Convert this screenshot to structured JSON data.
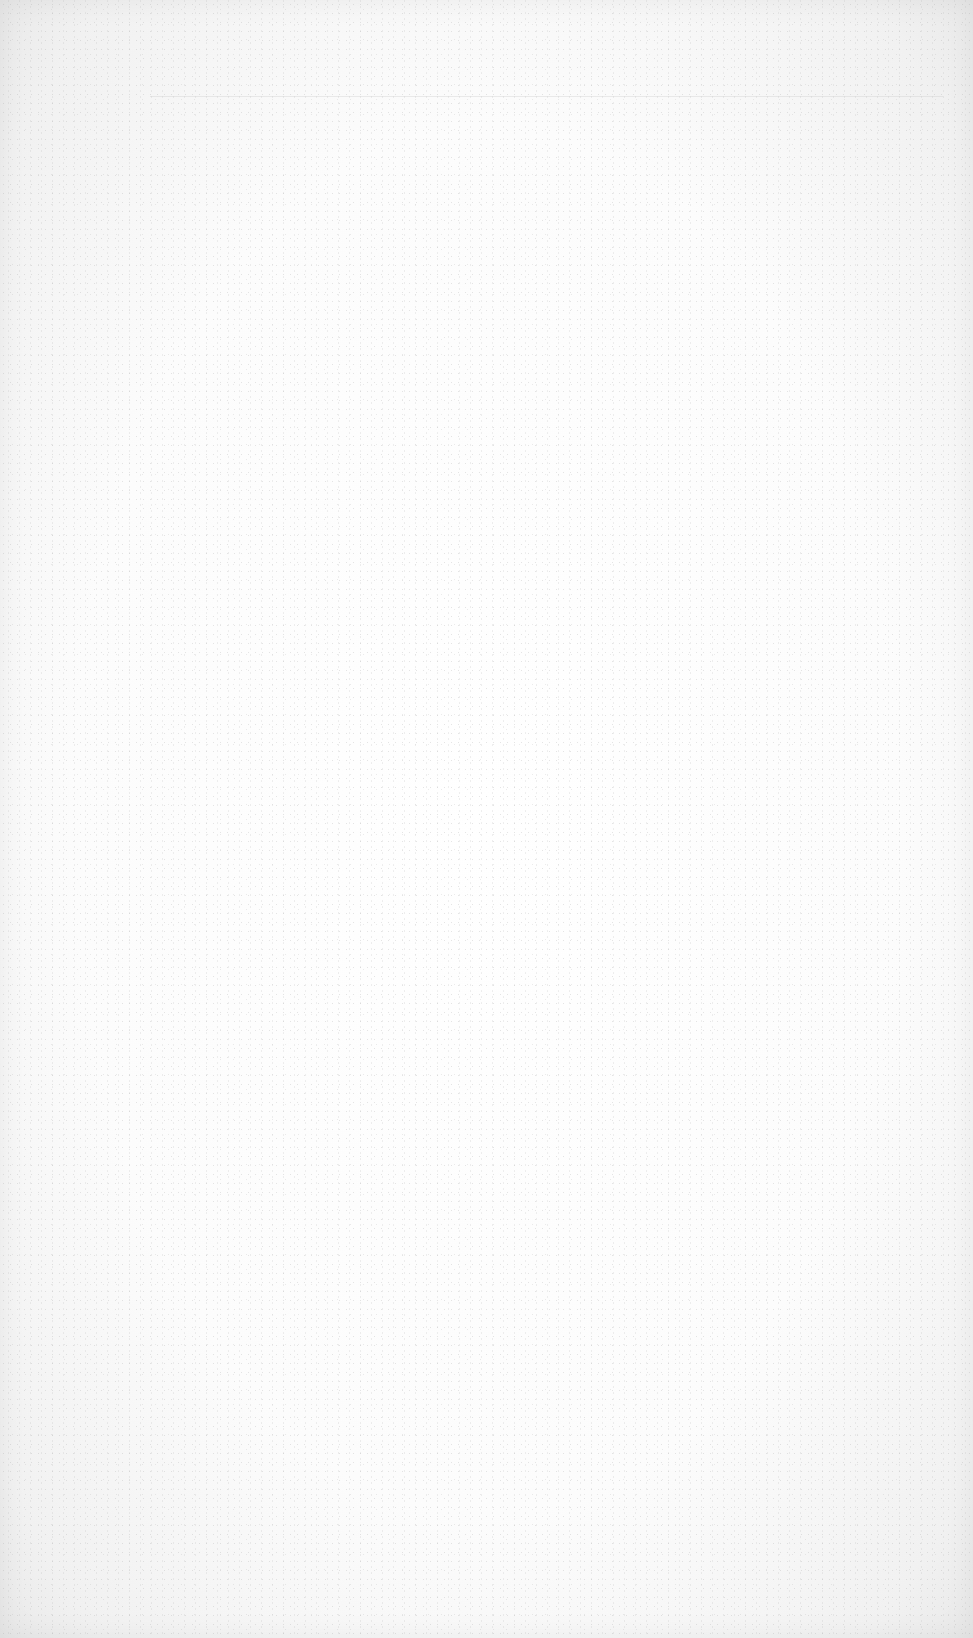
{
  "screen": {
    "state": "blank",
    "background_color": "#fcfcfc",
    "edge_shade_color": "#e9e9e9",
    "texture": "speckled-noise"
  }
}
